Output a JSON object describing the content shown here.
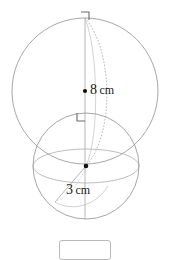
{
  "page": {
    "background_color": "#ffffff",
    "width": 170,
    "height": 252
  },
  "figure": {
    "type": "geometry-diagram",
    "stroke_color": "#8a8a8a",
    "dot_color": "#111111",
    "text_color": "#1a1a1a",
    "large_sphere": {
      "name": "large-sphere",
      "center": {
        "x": 85,
        "y": 91
      },
      "radius_px": 73,
      "radius_label": "8",
      "radius_unit": "cm",
      "center_dot": true,
      "right_angle_mark": {
        "x": 85,
        "y": 18,
        "label": "right-angle-mark-top"
      }
    },
    "small_sphere": {
      "name": "small-sphere",
      "center": {
        "x": 86,
        "y": 166
      },
      "radius_px": 53,
      "radius_label": "3",
      "radius_unit": "cm",
      "center_dot": true,
      "right_angle_mark": {
        "x": 80,
        "y": 117,
        "label": "right-angle-mark-middle"
      }
    }
  },
  "labels": {
    "large_radius": {
      "value": "8",
      "unit": "cm",
      "bullet": "•"
    },
    "small_radius": {
      "value": "3",
      "unit": "cm"
    }
  },
  "answer_input": {
    "value": "",
    "placeholder": ""
  }
}
